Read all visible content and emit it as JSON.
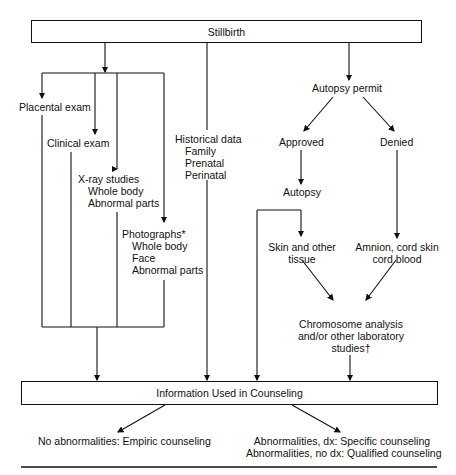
{
  "diagram": {
    "top_box": "Stillbirth",
    "left_branch": {
      "placental": "Placental exam",
      "clinical": "Clinical exam",
      "xray": {
        "title": "X-ray studies",
        "items": [
          "Whole body",
          "Abnormal parts"
        ]
      },
      "photographs": {
        "title": "Photographs*",
        "items": [
          "Whole body",
          "Face",
          "Abnormal parts"
        ]
      }
    },
    "historical": {
      "title": "Historical data",
      "items": [
        "Family",
        "Prenatal",
        "Perinatal"
      ]
    },
    "autopsy_branch": {
      "permit": "Autopsy permit",
      "approved": "Approved",
      "denied": "Denied",
      "autopsy": "Autopsy",
      "skin": [
        "Skin and other",
        "tissue"
      ],
      "amnion": [
        "Amnion, cord skin",
        "cord blood"
      ],
      "chromosome": [
        "Chromosome analysis",
        "and/or other laboratory",
        "studies†"
      ]
    },
    "bottom_box": "Information Used in Counseling",
    "outcomes": {
      "left": "No abnormalities: Empiric counseling",
      "right": [
        "Abnormalities, dx: Specific counseling",
        "Abnormalities, no dx: Qualified counseling"
      ]
    }
  }
}
